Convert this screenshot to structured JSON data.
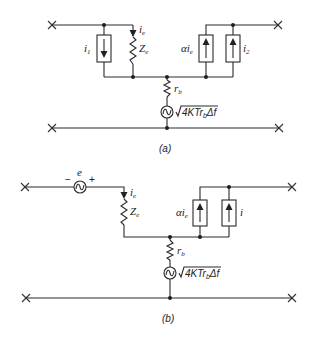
{
  "figure": {
    "panel_a": {
      "caption": "(a)",
      "labels": {
        "i1": "i",
        "i1_sub": "1",
        "ie": "i",
        "ie_sub": "e",
        "Ze": "Z",
        "Ze_sub": "e",
        "alpha_ie": "αi",
        "alpha_ie_sub": "e",
        "i2": "i",
        "i2_sub": "2",
        "rb": "r",
        "rb_sub": "b",
        "noise_prefix": "4KTr",
        "noise_sub": "b",
        "noise_suffix": "Δf"
      }
    },
    "panel_b": {
      "caption": "(b)",
      "labels": {
        "e": "e",
        "minus": "−",
        "plus": "+",
        "ie": "i",
        "ie_sub": "e",
        "Ze": "Z",
        "Ze_sub": "e",
        "alpha_ie": "αi",
        "alpha_ie_sub": "e",
        "i": "i",
        "rb": "r",
        "rb_sub": "b",
        "noise_prefix": "4KTr",
        "noise_sub": "b",
        "noise_suffix": "Δf"
      }
    }
  }
}
